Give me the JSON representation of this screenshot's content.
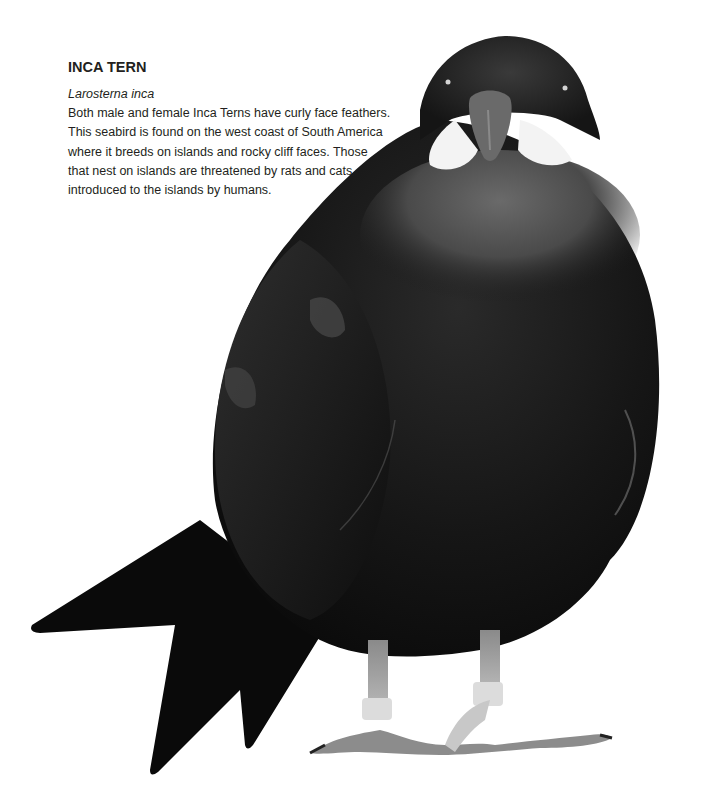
{
  "entry": {
    "title": "INCA TERN",
    "scientific_name": "Larosterna inca",
    "description_lines": [
      "Both male and female Inca Terns have curly face feathers.",
      "This seabird is found on the west coast of South America",
      "where it breeds on islands and rocky cliff faces. Those",
      "that nest on islands are threatened by rats and cats",
      "introduced to the islands by humans."
    ]
  },
  "photo": {
    "subject": "Inca Tern standing, front view",
    "colors": {
      "plumage": "#1a1a1a",
      "head": "#2b2b2b",
      "breast_highlight": "#5a5a5a",
      "moustache": "#f2f2f2",
      "beak": "#6a6a6a",
      "legs": "#a8a8a8",
      "leg_bands": "#dcdcdc",
      "background": "#ffffff"
    }
  }
}
